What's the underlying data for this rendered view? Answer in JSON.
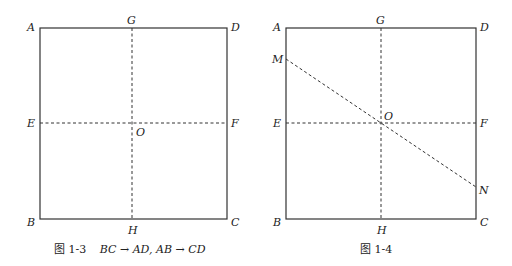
{
  "figures": [
    {
      "id": "fig-1-3",
      "caption_prefix": "图 1-3",
      "caption_math": "BC → AD, AB → CD",
      "labels": {
        "A": "A",
        "B": "B",
        "C": "C",
        "D": "D",
        "E": "E",
        "F": "F",
        "G": "G",
        "H": "H",
        "O": "O"
      }
    },
    {
      "id": "fig-1-4",
      "caption_prefix": "图 1-4",
      "labels": {
        "A": "A",
        "B": "B",
        "C": "C",
        "D": "D",
        "E": "E",
        "F": "F",
        "G": "G",
        "H": "H",
        "O": "O",
        "M": "M",
        "N": "N"
      }
    }
  ]
}
